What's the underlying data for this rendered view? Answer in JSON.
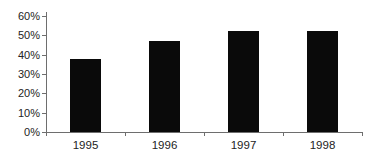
{
  "chart_data": {
    "type": "bar",
    "categories": [
      "1995",
      "1996",
      "1997",
      "1998"
    ],
    "values": [
      38,
      47,
      52,
      52
    ],
    "xlabel": "",
    "ylabel": "",
    "ylim": [
      0,
      60
    ],
    "ytick_step": 10,
    "ytick_labels": [
      "0%",
      "10%",
      "20%",
      "30%",
      "40%",
      "50%",
      "60%"
    ],
    "legend": "none",
    "grid": "off",
    "bar_color": "#0a0a0a",
    "axis_color": "#6e6e6e",
    "text_color": "#232323",
    "background_color": "#ffffff"
  }
}
